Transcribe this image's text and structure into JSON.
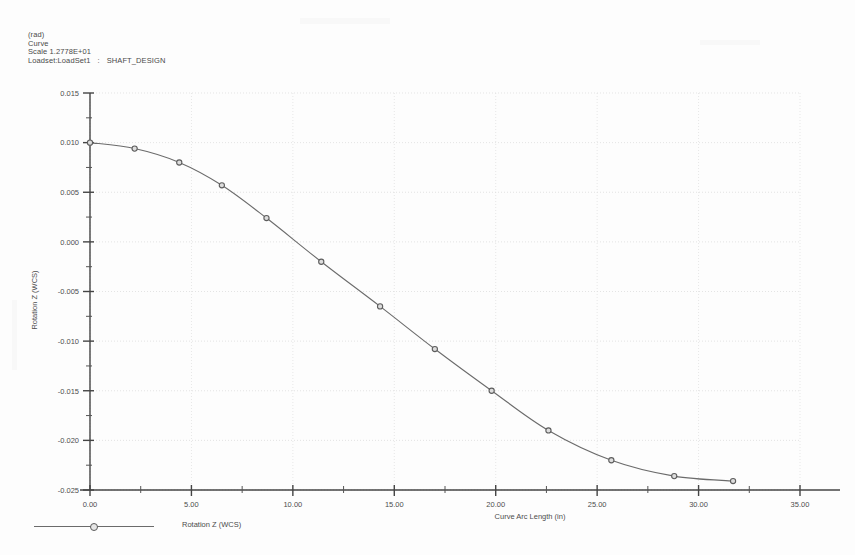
{
  "header": {
    "unit_line": "(rad)",
    "type_line": "Curve",
    "scale_line": "Scale  1.2778E+01",
    "loadset_prefix": "Loadset:LoadSet1",
    "loadset_sep": ":",
    "loadset_name": "SHAFT_DESIGN"
  },
  "legend": {
    "entry_label": "Rotation Z (WCS)",
    "marker": "circle-marker",
    "line_color": "#6b6b6b"
  },
  "chart_data": {
    "type": "line",
    "title": "",
    "xlabel": "Curve Arc Length (in)",
    "ylabel": "Rotation Z (WCS)",
    "xlim": [
      0,
      35
    ],
    "ylim": [
      -0.025,
      0.015
    ],
    "xticks": [
      0,
      5,
      10,
      15,
      20,
      25,
      30,
      35
    ],
    "xticklabels": [
      "0.00",
      "5.00",
      "10.00",
      "15.00",
      "20.00",
      "25.00",
      "30.00",
      "35.00"
    ],
    "yticks": [
      -0.025,
      -0.02,
      -0.015,
      -0.01,
      -0.005,
      0.0,
      0.005,
      0.01,
      0.015
    ],
    "yticklabels": [
      "-0.025",
      "-0.020",
      "-0.015",
      "-0.010",
      "-0.005",
      "0.000",
      "0.005",
      "0.010",
      "0.015"
    ],
    "minor_tick_count": 1,
    "grid": true,
    "grid_style": "dotted",
    "legend_position": "bottom-left",
    "line_color": "#6b6b6b",
    "marker": "open-circle",
    "series": [
      {
        "name": "Rotation Z (WCS)",
        "x": [
          0.0,
          2.2,
          4.4,
          6.5,
          8.7,
          11.4,
          14.3,
          17.0,
          19.8,
          22.6,
          25.7,
          28.8,
          31.7
        ],
        "y": [
          0.01,
          0.0094,
          0.008,
          0.0057,
          0.0024,
          -0.002,
          -0.0065,
          -0.0108,
          -0.015,
          -0.019,
          -0.022,
          -0.0236,
          -0.0241
        ]
      }
    ]
  }
}
